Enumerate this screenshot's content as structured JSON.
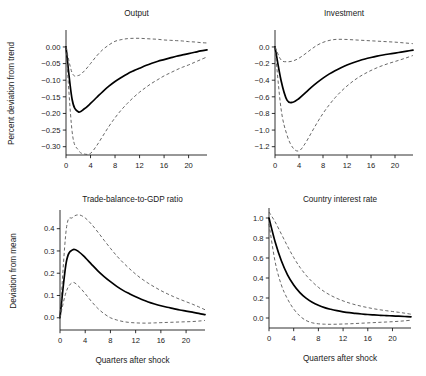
{
  "figure": {
    "background": "#ffffff",
    "mean_color": "#000000",
    "band_color": "#4d4d4d",
    "shared_xlabel": "Quarters after shock"
  },
  "chart_data": [
    {
      "id": "output",
      "type": "line",
      "title": "Output",
      "xlabel": "",
      "ylabel": "Percent deviation from trend",
      "xlim": [
        0,
        23
      ],
      "ylim": [
        -0.325,
        0.045
      ],
      "xticks": [
        0,
        4,
        8,
        12,
        16,
        20
      ],
      "xticklabels": [
        "0",
        "4",
        "8",
        "12",
        "16",
        "20"
      ],
      "yticks": [
        0.0,
        -0.05,
        -0.1,
        -0.15,
        -0.2,
        -0.25,
        -0.3
      ],
      "yticklabels": [
        "0.00",
        "−0.05",
        "−0.10",
        "−0.15",
        "−0.20",
        "−0.25",
        "−0.30"
      ],
      "grid": false,
      "legend": null,
      "x": [
        0,
        1,
        2,
        3,
        4,
        5,
        6,
        7,
        8,
        9,
        10,
        11,
        12,
        13,
        14,
        15,
        16,
        17,
        18,
        19,
        20,
        21,
        22,
        23
      ],
      "series": [
        {
          "name": "mean",
          "style": "solid",
          "values": [
            0.0,
            -0.158,
            -0.195,
            -0.186,
            -0.17,
            -0.152,
            -0.134,
            -0.118,
            -0.104,
            -0.092,
            -0.081,
            -0.072,
            -0.064,
            -0.056,
            -0.049,
            -0.043,
            -0.038,
            -0.033,
            -0.028,
            -0.024,
            -0.02,
            -0.016,
            -0.012,
            -0.009
          ]
        },
        {
          "name": "upper-band",
          "style": "dashed",
          "values": [
            0.0,
            -0.078,
            -0.086,
            -0.072,
            -0.05,
            -0.027,
            -0.008,
            0.006,
            0.017,
            0.022,
            0.025,
            0.026,
            0.026,
            0.025,
            0.024,
            0.023,
            0.021,
            0.02,
            0.019,
            0.018,
            0.016,
            0.015,
            0.013,
            0.012
          ]
        },
        {
          "name": "lower-band",
          "style": "dashed",
          "values": [
            0.0,
            -0.255,
            -0.31,
            -0.322,
            -0.32,
            -0.297,
            -0.268,
            -0.239,
            -0.213,
            -0.19,
            -0.17,
            -0.152,
            -0.136,
            -0.122,
            -0.109,
            -0.098,
            -0.087,
            -0.078,
            -0.069,
            -0.061,
            -0.054,
            -0.046,
            -0.038,
            -0.03
          ]
        }
      ]
    },
    {
      "id": "investment",
      "type": "line",
      "title": "Investment",
      "xlabel": "",
      "ylabel": "",
      "xlim": [
        0,
        23
      ],
      "ylim": [
        -1.3,
        0.18
      ],
      "xticks": [
        0,
        4,
        8,
        12,
        16,
        20
      ],
      "xticklabels": [
        "0",
        "4",
        "8",
        "12",
        "16",
        "20"
      ],
      "yticks": [
        0.0,
        -0.2,
        -0.4,
        -0.6,
        -0.8,
        -1.0,
        -1.2
      ],
      "yticklabels": [
        "0.0",
        "−0.2",
        "−0.4",
        "−0.6",
        "−0.8",
        "−1.0",
        "−1.2"
      ],
      "grid": false,
      "legend": null,
      "x": [
        0,
        1,
        2,
        3,
        4,
        5,
        6,
        7,
        8,
        9,
        10,
        11,
        12,
        13,
        14,
        15,
        16,
        17,
        18,
        19,
        20,
        21,
        22,
        23
      ],
      "series": [
        {
          "name": "mean",
          "style": "solid",
          "values": [
            0.0,
            -0.4,
            -0.64,
            -0.665,
            -0.62,
            -0.555,
            -0.49,
            -0.43,
            -0.375,
            -0.327,
            -0.285,
            -0.249,
            -0.217,
            -0.19,
            -0.166,
            -0.145,
            -0.127,
            -0.111,
            -0.097,
            -0.085,
            -0.074,
            -0.062,
            -0.05,
            -0.038
          ]
        },
        {
          "name": "upper-band",
          "style": "dashed",
          "values": [
            0.0,
            -0.155,
            -0.178,
            -0.168,
            -0.135,
            -0.085,
            -0.03,
            0.02,
            0.055,
            0.078,
            0.09,
            0.092,
            0.09,
            0.086,
            0.082,
            0.078,
            0.074,
            0.07,
            0.066,
            0.062,
            0.058,
            0.052,
            0.046,
            0.04
          ]
        },
        {
          "name": "lower-band",
          "style": "dashed",
          "values": [
            0.0,
            -0.74,
            -1.06,
            -1.215,
            -1.25,
            -1.165,
            -1.04,
            -0.915,
            -0.8,
            -0.7,
            -0.612,
            -0.536,
            -0.47,
            -0.412,
            -0.362,
            -0.32,
            -0.283,
            -0.25,
            -0.222,
            -0.197,
            -0.175,
            -0.152,
            -0.128,
            -0.102
          ]
        }
      ]
    },
    {
      "id": "trade-balance-to-gdp-ratio",
      "type": "line",
      "title": "Trade-balance-to-GDP ratio",
      "xlabel": "Quarters after shock",
      "ylabel": "Deviation from mean",
      "xlim": [
        0,
        23
      ],
      "ylim": [
        -0.055,
        0.475
      ],
      "xticks": [
        0,
        4,
        8,
        12,
        16,
        20
      ],
      "xticklabels": [
        "0",
        "4",
        "8",
        "12",
        "16",
        "20"
      ],
      "yticks": [
        0.0,
        0.1,
        0.2,
        0.3,
        0.4
      ],
      "yticklabels": [
        "0.0",
        "0.1",
        "0.2",
        "0.3",
        "0.4"
      ],
      "grid": false,
      "legend": null,
      "x": [
        0,
        1,
        2,
        3,
        4,
        5,
        6,
        7,
        8,
        9,
        10,
        11,
        12,
        13,
        14,
        15,
        16,
        17,
        18,
        19,
        20,
        21,
        22,
        23
      ],
      "series": [
        {
          "name": "mean",
          "style": "solid",
          "values": [
            0.0,
            0.25,
            0.305,
            0.296,
            0.27,
            0.24,
            0.211,
            0.185,
            0.162,
            0.141,
            0.123,
            0.108,
            0.094,
            0.082,
            0.071,
            0.062,
            0.054,
            0.047,
            0.041,
            0.035,
            0.03,
            0.025,
            0.02,
            0.014
          ]
        },
        {
          "name": "upper-band",
          "style": "dashed",
          "values": [
            0.0,
            0.398,
            0.45,
            0.462,
            0.448,
            0.42,
            0.385,
            0.348,
            0.312,
            0.278,
            0.248,
            0.221,
            0.196,
            0.174,
            0.155,
            0.138,
            0.122,
            0.108,
            0.095,
            0.083,
            0.072,
            0.061,
            0.049,
            0.036
          ]
        },
        {
          "name": "lower-band",
          "style": "dashed",
          "values": [
            0.0,
            0.118,
            0.158,
            0.14,
            0.108,
            0.073,
            0.042,
            0.018,
            0.0,
            -0.01,
            -0.017,
            -0.021,
            -0.023,
            -0.024,
            -0.024,
            -0.023,
            -0.022,
            -0.021,
            -0.02,
            -0.019,
            -0.018,
            -0.017,
            -0.015,
            -0.012
          ]
        }
      ]
    },
    {
      "id": "country-interest-rate",
      "type": "line",
      "title": "Country interest rate",
      "xlabel": "Quarters after shock",
      "ylabel": "",
      "xlim": [
        0,
        23
      ],
      "ylim": [
        -0.1,
        1.08
      ],
      "xticks": [
        0,
        4,
        8,
        12,
        16,
        20
      ],
      "xticklabels": [
        "0",
        "4",
        "8",
        "12",
        "16",
        "20"
      ],
      "yticks": [
        0.0,
        0.2,
        0.4,
        0.6,
        0.8,
        1.0
      ],
      "yticklabels": [
        "0.0",
        "0.2",
        "0.4",
        "0.6",
        "0.8",
        "1.0"
      ],
      "grid": false,
      "legend": null,
      "x": [
        0,
        1,
        2,
        3,
        4,
        5,
        6,
        7,
        8,
        9,
        10,
        11,
        12,
        13,
        14,
        15,
        16,
        17,
        18,
        19,
        20,
        21,
        22,
        23
      ],
      "series": [
        {
          "name": "mean",
          "style": "solid",
          "values": [
            1.0,
            0.76,
            0.572,
            0.432,
            0.33,
            0.254,
            0.198,
            0.157,
            0.127,
            0.104,
            0.087,
            0.073,
            0.062,
            0.053,
            0.046,
            0.04,
            0.035,
            0.031,
            0.027,
            0.024,
            0.021,
            0.018,
            0.015,
            0.012
          ]
        },
        {
          "name": "upper-band",
          "style": "dashed",
          "values": [
            1.06,
            0.96,
            0.84,
            0.718,
            0.605,
            0.508,
            0.428,
            0.362,
            0.307,
            0.262,
            0.226,
            0.196,
            0.171,
            0.15,
            0.132,
            0.117,
            0.104,
            0.092,
            0.082,
            0.073,
            0.065,
            0.057,
            0.048,
            0.038
          ]
        },
        {
          "name": "lower-band",
          "style": "dashed",
          "values": [
            0.94,
            0.56,
            0.33,
            0.19,
            0.09,
            0.02,
            -0.025,
            -0.048,
            -0.058,
            -0.062,
            -0.063,
            -0.062,
            -0.06,
            -0.058,
            -0.055,
            -0.052,
            -0.049,
            -0.046,
            -0.043,
            -0.04,
            -0.037,
            -0.033,
            -0.028,
            -0.022
          ]
        }
      ]
    }
  ]
}
